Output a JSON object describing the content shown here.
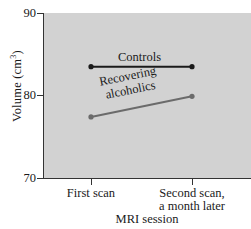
{
  "chart_data": {
    "type": "line",
    "title": "",
    "xlabel": "MRI session",
    "ylabel": "Volume (cm3)",
    "ylabel_base": "Volume (cm",
    "ylabel_exponent": "3",
    "ylabel_close": ")",
    "categories": [
      "First scan",
      "Second scan, a month later"
    ],
    "x_tick_labels": [
      {
        "line1": "First scan",
        "line2": ""
      },
      {
        "line1": "Second scan,",
        "line2": "a month later"
      }
    ],
    "y_ticks": [
      "90",
      "80",
      "70"
    ],
    "ylim": [
      70,
      90
    ],
    "grid": false,
    "legend": "inline-annotations",
    "plot_background": "#d2d2d2",
    "series": [
      {
        "name": "Controls",
        "color": "#1a1a1a",
        "values": [
          83.5,
          83.5
        ],
        "label_text": "Controls"
      },
      {
        "name": "Recovering alcoholics",
        "color": "#6b6b6b",
        "values": [
          77.4,
          79.9
        ],
        "label_line1": "Recovering",
        "label_line2": "alcoholics"
      }
    ]
  }
}
